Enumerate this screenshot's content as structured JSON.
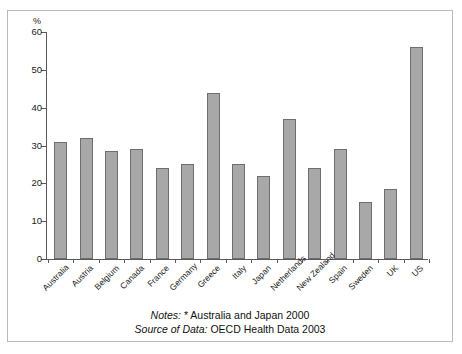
{
  "chart_data": {
    "type": "bar",
    "title": "",
    "subtitle": "",
    "xlabel": "",
    "ylabel": "%",
    "ylim": [
      0,
      60
    ],
    "yticks": [
      0,
      10,
      20,
      30,
      40,
      50,
      60
    ],
    "grid": false,
    "legend": null,
    "bar_color": "#a8a8a8",
    "bar_edge_color": "#6e6e6e",
    "categories": [
      "Australia",
      "Austria",
      "Belgium",
      "Canada",
      "France",
      "Germany",
      "Greece",
      "Italy",
      "Japan",
      "Netherlands",
      "New Zealand",
      "Spain",
      "Sweden",
      "UK",
      "US"
    ],
    "values": [
      31,
      32,
      28.5,
      29,
      24,
      25,
      44,
      25,
      22,
      37,
      24,
      29,
      15,
      18.5,
      56
    ]
  },
  "notes": {
    "notes_label": "Notes:",
    "notes_text": "* Australia and Japan 2000",
    "source_label": "Source of Data:",
    "source_text": "OECD Health Data 2003"
  }
}
